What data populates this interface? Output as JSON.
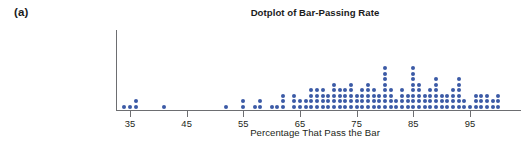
{
  "figure": {
    "panel_label": "(a)",
    "title": "Dotplot of Bar-Passing Rate",
    "xlabel": "Percentage That Pass the Bar"
  },
  "style": {
    "dot_color": "#3b5aa6",
    "axis_color": "#6d6e71",
    "text_color": "#231f20",
    "background": "#ffffff"
  },
  "axis": {
    "tick_labels": [
      "35",
      "45",
      "55",
      "65",
      "75",
      "85",
      "95"
    ],
    "tick_values": [
      35,
      45,
      55,
      65,
      75,
      85,
      95
    ]
  },
  "chart_data": {
    "type": "dotplot",
    "title": "Dotplot of Bar-Passing Rate",
    "subtitle": "",
    "xlabel": "Percentage That Pass the Bar",
    "ylabel": "",
    "xlim": [
      32,
      102
    ],
    "ylim": [
      0,
      9
    ],
    "grid": false,
    "legend": "none",
    "xticks": [
      35,
      45,
      55,
      65,
      75,
      85,
      95
    ],
    "dot_unit": 1,
    "note": "Each dot represents one observation (a law school). Value = percentage of graduates that pass the bar exam.",
    "counts_by_value": [
      {
        "x": 34,
        "count": 1
      },
      {
        "x": 35,
        "count": 1
      },
      {
        "x": 36,
        "count": 2
      },
      {
        "x": 41,
        "count": 1
      },
      {
        "x": 52,
        "count": 1
      },
      {
        "x": 55,
        "count": 2
      },
      {
        "x": 57,
        "count": 1
      },
      {
        "x": 58,
        "count": 2
      },
      {
        "x": 60,
        "count": 1
      },
      {
        "x": 61,
        "count": 1
      },
      {
        "x": 62,
        "count": 3
      },
      {
        "x": 64,
        "count": 3
      },
      {
        "x": 65,
        "count": 2
      },
      {
        "x": 66,
        "count": 2
      },
      {
        "x": 67,
        "count": 4
      },
      {
        "x": 68,
        "count": 4
      },
      {
        "x": 69,
        "count": 4
      },
      {
        "x": 70,
        "count": 3
      },
      {
        "x": 71,
        "count": 5
      },
      {
        "x": 72,
        "count": 4
      },
      {
        "x": 73,
        "count": 4
      },
      {
        "x": 74,
        "count": 5
      },
      {
        "x": 75,
        "count": 3
      },
      {
        "x": 76,
        "count": 4
      },
      {
        "x": 77,
        "count": 5
      },
      {
        "x": 78,
        "count": 4
      },
      {
        "x": 79,
        "count": 3
      },
      {
        "x": 80,
        "count": 8
      },
      {
        "x": 81,
        "count": 4
      },
      {
        "x": 82,
        "count": 2
      },
      {
        "x": 83,
        "count": 4
      },
      {
        "x": 84,
        "count": 3
      },
      {
        "x": 85,
        "count": 8
      },
      {
        "x": 86,
        "count": 5
      },
      {
        "x": 87,
        "count": 3
      },
      {
        "x": 88,
        "count": 4
      },
      {
        "x": 89,
        "count": 6
      },
      {
        "x": 90,
        "count": 3
      },
      {
        "x": 91,
        "count": 3
      },
      {
        "x": 92,
        "count": 4
      },
      {
        "x": 93,
        "count": 6
      },
      {
        "x": 94,
        "count": 2
      },
      {
        "x": 95,
        "count": 1
      },
      {
        "x": 96,
        "count": 3
      },
      {
        "x": 97,
        "count": 3
      },
      {
        "x": 98,
        "count": 3
      },
      {
        "x": 99,
        "count": 2
      },
      {
        "x": 100,
        "count": 3
      }
    ]
  }
}
